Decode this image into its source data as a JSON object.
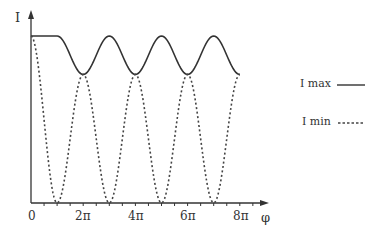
{
  "chart_data": {
    "type": "line",
    "title": "",
    "xlabel": "φ",
    "ylabel": "I",
    "x_ticks": [
      "0",
      "2π",
      "4π",
      "6π",
      "8π"
    ],
    "x_tick_values_pi": [
      0,
      2,
      4,
      6,
      8
    ],
    "xlim_pi": [
      0,
      8.5
    ],
    "ylim": [
      0,
      1
    ],
    "grid": false,
    "legend_position": "right",
    "series": [
      {
        "name": "I max",
        "style": "solid",
        "description": "Flat at 1.0 from φ=0 to ~φ=π, then oscillates between ~0.77 (at 2π,4π,6π,8π) and 1.0 (at 3π,5π,7π)",
        "x_pi": [
          0,
          1,
          2,
          3,
          4,
          5,
          6,
          7,
          8
        ],
        "values": [
          1.0,
          1.0,
          0.77,
          1.0,
          0.77,
          1.0,
          0.77,
          1.0,
          0.77
        ]
      },
      {
        "name": "I min",
        "style": "dashed",
        "description": "Starts at 1.0 at φ=0, falls to 0 at odd multiples of π, rises to meet I max troughs at even multiples of π",
        "x_pi": [
          0,
          1,
          2,
          3,
          4,
          5,
          6,
          7,
          8
        ],
        "values": [
          1.0,
          0.0,
          0.77,
          0.0,
          0.77,
          0.0,
          0.77,
          0.0,
          0.77
        ]
      }
    ]
  },
  "axes": {
    "y_label": "I",
    "x_label": "φ",
    "ticks": [
      "0",
      "2π",
      "4π",
      "6π",
      "8π"
    ]
  },
  "legend": {
    "items": [
      {
        "label": "I max",
        "style": "solid"
      },
      {
        "label": "I min",
        "style": "dashed"
      }
    ]
  },
  "colors": {
    "line": "#333333",
    "axis": "#333333",
    "background": "#ffffff"
  }
}
